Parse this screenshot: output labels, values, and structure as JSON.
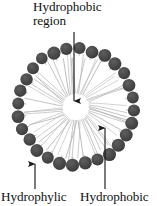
{
  "figure": {
    "type": "micelle-cross-section-diagram",
    "title": {
      "line1": "Hydrophobic",
      "line2": "region"
    },
    "labels": {
      "hydrophylic": "Hydrophylic",
      "hydrophobic": "Hydrophobic"
    },
    "colors": {
      "background": "#ffffff",
      "head_group": "#4a4a4a",
      "head_group_dark": "#3c3c3c",
      "tail": "#b9b9b9",
      "arrow": "#1a1a1a",
      "text": "#111111",
      "core": "#ffffff"
    },
    "geometry": {
      "center_x": 76,
      "center_y": 107,
      "head_ring_radius": 58,
      "head_radius": 6.2,
      "core_radius": 12,
      "head_count": 28,
      "tail_inner_radius": 13,
      "tail_outer_radius": 51
    },
    "annotations": [
      {
        "name": "hydrophobic-region-arrow",
        "points_to": "core",
        "direction": "down",
        "x": 74,
        "y_start": 32,
        "y_end": 108
      },
      {
        "name": "hydrophylic-arrow",
        "points_to": "head-group",
        "direction": "up",
        "x": 35,
        "y_start": 189,
        "y_end": 157
      },
      {
        "name": "hydrophobic-arrow",
        "points_to": "tail-region",
        "direction": "up",
        "x": 105,
        "y_start": 189,
        "y_end": 121
      }
    ]
  }
}
